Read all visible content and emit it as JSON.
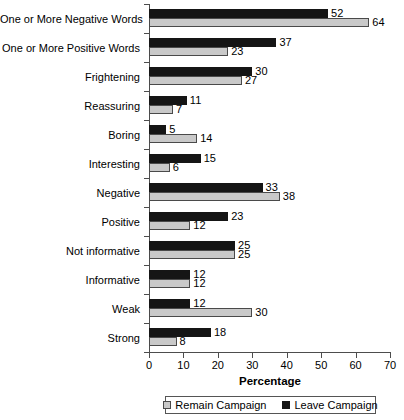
{
  "chart_data": {
    "type": "bar",
    "orientation": "horizontal",
    "title": "",
    "xlabel": "Percentage",
    "ylabel": "",
    "xlim": [
      0,
      70
    ],
    "xticks": [
      0,
      10,
      20,
      30,
      40,
      50,
      60,
      70
    ],
    "grid": false,
    "legend_position": "bottom",
    "categories": [
      "One or More Negative Words",
      "One or More Positive Words",
      "Frightening",
      "Reassuring",
      "Boring",
      "Interesting",
      "Negative",
      "Positive",
      "Not informative",
      "Informative",
      "Weak",
      "Strong"
    ],
    "series": [
      {
        "name": "Leave Campaign",
        "color": "#151515",
        "values": [
          52,
          37,
          30,
          11,
          5,
          15,
          33,
          23,
          25,
          12,
          12,
          18
        ]
      },
      {
        "name": "Remain Campaign",
        "color": "#c9c9c9",
        "values": [
          64,
          23,
          27,
          7,
          14,
          6,
          38,
          12,
          25,
          12,
          30,
          8
        ]
      }
    ]
  },
  "legend": {
    "items": [
      {
        "label": "Remain Campaign",
        "swatch": "light-gray-square"
      },
      {
        "label": "Leave Campaign",
        "swatch": "black-square"
      }
    ]
  }
}
